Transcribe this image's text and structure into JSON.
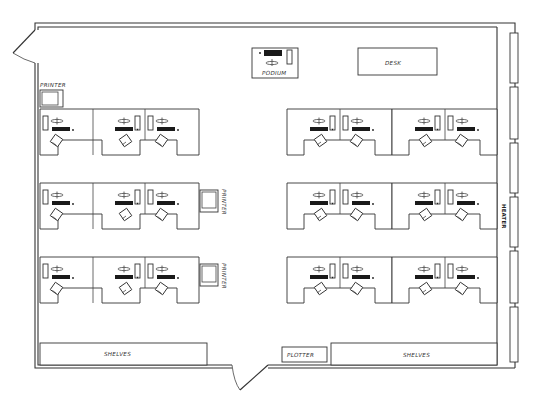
{
  "diagram": {
    "type": "office floor plan",
    "labels": {
      "podium": "PODIUM",
      "desk": "DESK",
      "printer_top_left": "PRINTER",
      "printer_middle_1": "PRINTER",
      "printer_middle_2": "PRINTER",
      "heater": "HEATER",
      "shelves_left": "SHELVES",
      "shelves_right": "SHELVES",
      "plotter": "PLOTTER"
    },
    "colors": {
      "line": "#333333",
      "background": "#ffffff",
      "keyboard_fill": "#1a1a1a"
    },
    "workstation_groups": [
      {
        "side": "left",
        "row": 1,
        "stations": 3
      },
      {
        "side": "left",
        "row": 2,
        "stations": 3
      },
      {
        "side": "left",
        "row": 3,
        "stations": 3
      },
      {
        "side": "right",
        "row": 1,
        "stations": 4
      },
      {
        "side": "right",
        "row": 2,
        "stations": 4
      },
      {
        "side": "right",
        "row": 3,
        "stations": 4
      }
    ],
    "doors": 2,
    "windows_right_wall": 6
  }
}
